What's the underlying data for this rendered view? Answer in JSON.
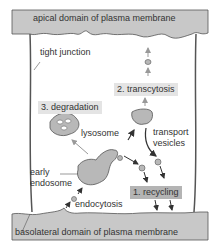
{
  "labels": {
    "apical": "apical domain of plasma membrane",
    "basolateral": "basolateral domain of plasma membrane",
    "tight_junction": "tight junction",
    "lysosome": "lysosome",
    "early_endosome_line1": "early",
    "early_endosome_line2": "endosome",
    "endocytosis": "endocytosis",
    "transport_line1": "transport",
    "transport_line2": "vesicles"
  },
  "pathways": {
    "recycling": "1. recycling",
    "transcytosis": "2. transcytosis",
    "degradation": "3. degradation"
  },
  "colors": {
    "membrane": "#c8c8c8",
    "organelle": "#b8b8b8",
    "outline": "#555555",
    "arrow": "#333333",
    "light_arrow": "#999999",
    "recycling_box": "#b4b4b4",
    "label_box": "#e4e4e4"
  }
}
